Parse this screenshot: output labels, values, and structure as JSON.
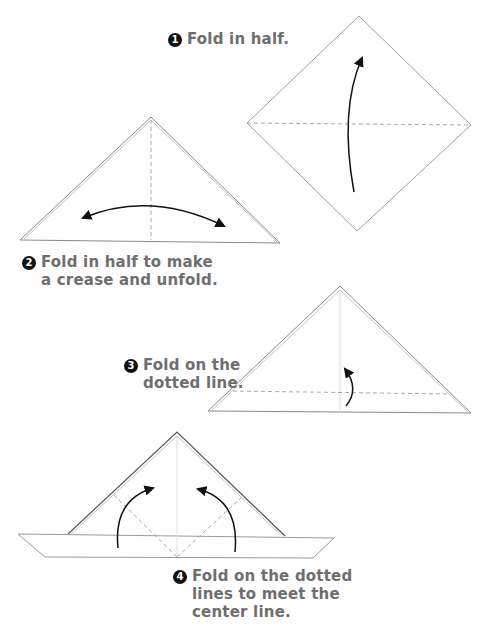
{
  "steps": [
    {
      "number": "1",
      "lines": [
        "Fold in half."
      ]
    },
    {
      "number": "2",
      "lines": [
        "Fold in half to make",
        "a crease and unfold."
      ]
    },
    {
      "number": "3",
      "lines": [
        "Fold on the",
        "dotted line."
      ]
    },
    {
      "number": "4",
      "lines": [
        "Fold on the dotted",
        "lines to meet the",
        "center line."
      ]
    }
  ],
  "colors": {
    "text": "#6e6e6e",
    "paper_edge": "#9a9a9a",
    "crease": "#a8a8a8",
    "arrow": "#111111",
    "badge": "#111111"
  }
}
